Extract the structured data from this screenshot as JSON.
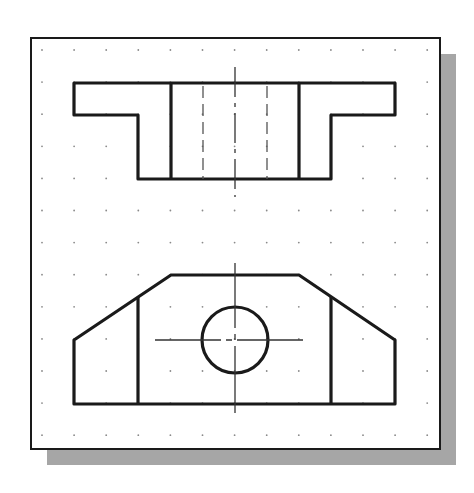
{
  "figure": {
    "colors": {
      "background": "#ffffff",
      "sheet": "#ffffff",
      "sheet_border": "#1a1a1a",
      "shadow": "#a6a6a6",
      "grid_dot": "#8a8a8a",
      "object_line": "#1a1a1a",
      "center_line": "#333333",
      "hidden_line": "#555555"
    },
    "sheet": {
      "x": 31,
      "y": 38,
      "width": 409,
      "height": 411,
      "shadow_offset": 16
    },
    "grid": {
      "x0": 42,
      "y0": 50,
      "spacing": 32.1,
      "cols": 13,
      "rows": 13
    },
    "top_view": {
      "outline": [
        [
          74,
          83
        ],
        [
          395,
          83
        ],
        [
          395,
          115
        ],
        [
          331,
          115
        ],
        [
          331,
          179
        ],
        [
          138,
          179
        ],
        [
          138,
          115
        ],
        [
          74,
          115
        ]
      ],
      "inner_lines": [
        {
          "x": 171,
          "y1": 83,
          "y2": 179
        },
        {
          "x": 299,
          "y1": 83,
          "y2": 179
        }
      ],
      "hidden_lines": [
        {
          "x": 203,
          "y1": 83,
          "y2": 179
        },
        {
          "x": 267,
          "y1": 83,
          "y2": 179
        }
      ],
      "center_line": {
        "x": 235,
        "y1": 67,
        "y2": 197
      }
    },
    "front_view": {
      "outline": [
        [
          171,
          275
        ],
        [
          299,
          275
        ],
        [
          395,
          340
        ],
        [
          395,
          404
        ],
        [
          74,
          404
        ],
        [
          74,
          340
        ]
      ],
      "inner_lines": [
        {
          "x": 138,
          "y1": 297,
          "y2": 404
        },
        {
          "x": 331,
          "y1": 297,
          "y2": 404
        }
      ],
      "hole": {
        "cx": 235,
        "cy": 340,
        "r": 33
      },
      "center_lines": {
        "horizontal": {
          "y": 340,
          "x1": 155,
          "x2": 323
        },
        "vertical": {
          "x": 235,
          "y1": 263,
          "y2": 413
        }
      }
    }
  }
}
